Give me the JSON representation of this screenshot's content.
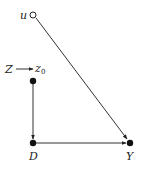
{
  "diagram": {
    "type": "causal-dag",
    "nodes": [
      {
        "id": "u",
        "label": "u",
        "style": "open",
        "x": 33,
        "y": 15
      },
      {
        "id": "z0",
        "label": "z",
        "subscript": "0",
        "style": "filled",
        "x": 33,
        "y": 81
      },
      {
        "id": "D",
        "label": "D",
        "style": "filled",
        "x": 33,
        "y": 143
      },
      {
        "id": "Y",
        "label": "Y",
        "style": "filled",
        "x": 130,
        "y": 143
      }
    ],
    "intervention": {
      "label": "Z",
      "target": "z0"
    },
    "edges": [
      {
        "from": "u",
        "to": "Y"
      },
      {
        "from": "z0",
        "to": "D"
      },
      {
        "from": "D",
        "to": "Y"
      },
      {
        "from": "Z",
        "to": "z0"
      }
    ],
    "colors": {
      "ink": "#222222",
      "background": "#ffffff"
    }
  }
}
